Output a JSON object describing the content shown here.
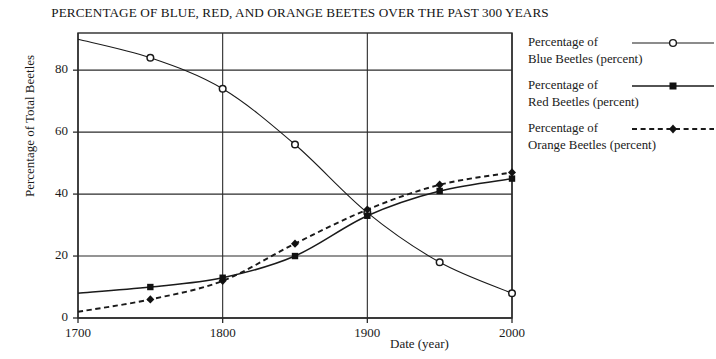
{
  "chart_data": {
    "type": "line",
    "title": "PERCENTAGE OF BLUE, RED, AND ORANGE BEETES OVER THE PAST 300 YEARS",
    "xlabel": "Date (year)",
    "ylabel": "Percentage of Total Beetles",
    "x": [
      1700,
      1750,
      1800,
      1850,
      1900,
      1950,
      2000
    ],
    "xlim": [
      1700,
      2000
    ],
    "ylim": [
      0,
      92
    ],
    "xticks": [
      "1700",
      "1800",
      "1900",
      "2000"
    ],
    "xtick_values": [
      1700,
      1800,
      1900,
      2000
    ],
    "yticks": [
      "0",
      "20",
      "40",
      "60",
      "80"
    ],
    "ytick_values": [
      0,
      20,
      40,
      60,
      80
    ],
    "grid": "horizontal-and-vertical",
    "legend_position": "right",
    "series": [
      {
        "name": "Percentage of Blue Beetles (percent)",
        "label_line1": "Percentage of",
        "label_line2": "Blue Beetles (percent)",
        "marker": "open-circle",
        "linestyle": "solid",
        "color": "#1a1a1a",
        "values": [
          90,
          84,
          74,
          56,
          34,
          18,
          8
        ]
      },
      {
        "name": "Percentage of Red Beetles (percent)",
        "label_line1": "Percentage of",
        "label_line2": "Red Beetles (percent)",
        "marker": "filled-square",
        "linestyle": "solid",
        "color": "#1a1a1a",
        "values": [
          8,
          10,
          13,
          20,
          33,
          41,
          45
        ]
      },
      {
        "name": "Percentage of Orange Beetles (percent)",
        "label_line1": "Percentage of",
        "label_line2": "Orange Beetles (percent)",
        "marker": "filled-diamond",
        "linestyle": "dashed",
        "color": "#1a1a1a",
        "values": [
          2,
          6,
          12,
          24,
          35,
          43,
          47
        ]
      }
    ]
  },
  "legend": {
    "entries": [
      {
        "line1": "Percentage of",
        "line2": "Blue Beetles (percent)"
      },
      {
        "line1": "Percentage of",
        "line2": "Red Beetles (percent)"
      },
      {
        "line1": "Percentage of",
        "line2": "Orange Beetles (percent)"
      }
    ]
  },
  "axes": {
    "y_label": "Percentage of Total Beetles",
    "x_label": "Date (year)",
    "y_ticks": [
      "80",
      "60",
      "40",
      "20",
      "0"
    ],
    "x_ticks": [
      "1700",
      "1800",
      "1900",
      "2000"
    ]
  },
  "title": "PERCENTAGE OF BLUE, RED, AND ORANGE BEETES OVER THE PAST 300 YEARS"
}
